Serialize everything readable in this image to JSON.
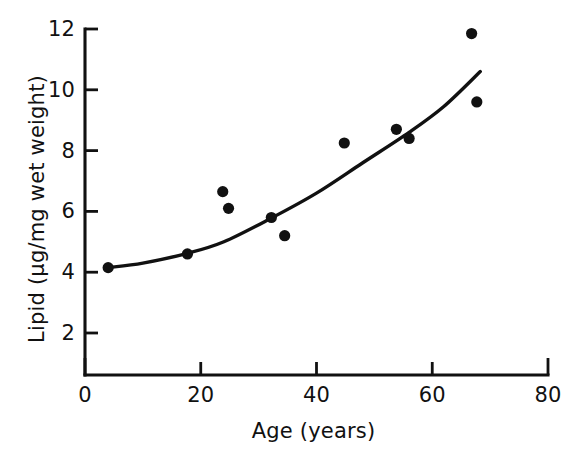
{
  "chart_data": {
    "type": "scatter",
    "title": "",
    "subtitle": "",
    "xlabel": "Age (years)",
    "ylabel": "Lipid (µg/mg wet weight)",
    "xlim": [
      0,
      80
    ],
    "ylim": [
      0,
      12
    ],
    "xticks": [
      0,
      20,
      40,
      60,
      80
    ],
    "yticks": [
      2,
      4,
      6,
      8,
      10,
      12
    ],
    "xtick_labels": [
      "0",
      "20",
      "40",
      "60",
      "80"
    ],
    "ytick_labels": [
      "2",
      "4",
      "6",
      "8",
      "10",
      "12"
    ],
    "grid": false,
    "legend": null,
    "marker": "filled-circle",
    "marker_color": "#111111",
    "line_color": "#111111",
    "background_color": "#ffffff",
    "x": [
      4.0,
      17.7,
      23.8,
      24.8,
      32.2,
      34.5,
      44.8,
      53.8,
      56.0,
      66.8,
      67.7
    ],
    "y": [
      4.15,
      4.6,
      6.65,
      6.1,
      5.8,
      5.2,
      8.25,
      8.7,
      8.4,
      11.85,
      9.6
    ],
    "points": [
      {
        "x": 4.0,
        "y": 4.15
      },
      {
        "x": 17.7,
        "y": 4.6
      },
      {
        "x": 23.8,
        "y": 6.65
      },
      {
        "x": 24.8,
        "y": 6.1
      },
      {
        "x": 32.2,
        "y": 5.8
      },
      {
        "x": 34.5,
        "y": 5.2
      },
      {
        "x": 44.8,
        "y": 8.25
      },
      {
        "x": 53.8,
        "y": 8.7
      },
      {
        "x": 56.0,
        "y": 8.4
      },
      {
        "x": 66.8,
        "y": 11.85
      },
      {
        "x": 67.7,
        "y": 9.6
      }
    ],
    "series": [
      {
        "name": "Lipid vs Age",
        "type": "scatter",
        "values": [
          4.15,
          4.6,
          6.65,
          6.1,
          5.8,
          5.2,
          8.25,
          8.7,
          8.4,
          11.85,
          9.6
        ]
      },
      {
        "name": "fitted curve",
        "type": "line",
        "x_range": [
          4.0,
          68.3
        ],
        "curve_points": [
          {
            "x": 4.0,
            "y": 4.15
          },
          {
            "x": 10.0,
            "y": 4.3
          },
          {
            "x": 17.7,
            "y": 4.62
          },
          {
            "x": 24.0,
            "y": 5.0
          },
          {
            "x": 32.2,
            "y": 5.78
          },
          {
            "x": 40.0,
            "y": 6.6
          },
          {
            "x": 48.0,
            "y": 7.6
          },
          {
            "x": 56.0,
            "y": 8.6
          },
          {
            "x": 62.0,
            "y": 9.45
          },
          {
            "x": 68.3,
            "y": 10.6
          }
        ]
      }
    ]
  },
  "axes": {
    "x_title": "Age (years)",
    "y_title": "Lipid (µg/mg wet weight)"
  }
}
